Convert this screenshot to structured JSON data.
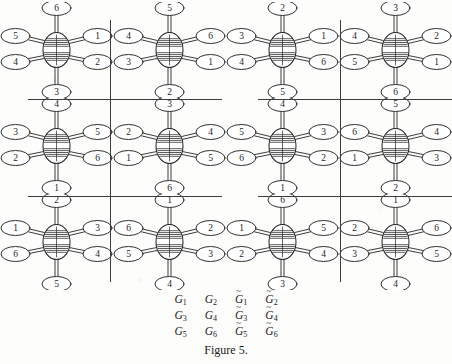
{
  "figure": {
    "caption": "Figure 5.",
    "background_color": "#fdfdfc",
    "ink_color": "#262626",
    "divider_color": "#3d3d3d"
  },
  "label_table": {
    "rows": [
      [
        {
          "base": "G",
          "tilde": false,
          "sub": "1"
        },
        {
          "base": "G",
          "tilde": false,
          "sub": "2"
        },
        {
          "base": "G",
          "tilde": true,
          "sub": "1"
        },
        {
          "base": "G",
          "tilde": true,
          "sub": "2"
        }
      ],
      [
        {
          "base": "G",
          "tilde": false,
          "sub": "3"
        },
        {
          "base": "G",
          "tilde": false,
          "sub": "4"
        },
        {
          "base": "G",
          "tilde": true,
          "sub": "3"
        },
        {
          "base": "G",
          "tilde": true,
          "sub": "4"
        }
      ],
      [
        {
          "base": "G",
          "tilde": false,
          "sub": "5"
        },
        {
          "base": "G",
          "tilde": false,
          "sub": "6"
        },
        {
          "base": "G",
          "tilde": true,
          "sub": "5"
        },
        {
          "base": "G",
          "tilde": true,
          "sub": "6"
        }
      ]
    ],
    "flat_labels": [
      "G1",
      "G2",
      "G~1",
      "G~2",
      "G3",
      "G4",
      "G~3",
      "G~4",
      "G5",
      "G6",
      "G~5",
      "G~6"
    ]
  },
  "grid": {
    "columns": 4,
    "rows": 3,
    "cell_width": 113,
    "cell_height": 96,
    "vertical_dividers_x": [
      110,
      340
    ],
    "horizontal_divider_rows": [
      {
        "y": 99,
        "segments": [
          [
            28,
            222
          ],
          [
            258,
            452
          ]
        ]
      },
      {
        "y": 196,
        "segments": [
          [
            28,
            222
          ],
          [
            258,
            452
          ]
        ]
      }
    ]
  },
  "molecules": [
    {
      "name": "G1",
      "row": 0,
      "col": 0,
      "positions": {
        "top": "6",
        "upper_right": "1",
        "lower_right": "2",
        "bottom": "3",
        "lower_left": "4",
        "upper_left": "5"
      }
    },
    {
      "name": "G2",
      "row": 0,
      "col": 1,
      "positions": {
        "top": "5",
        "upper_right": "6",
        "lower_right": "1",
        "bottom": "2",
        "lower_left": "3",
        "upper_left": "4"
      }
    },
    {
      "name": "G~1",
      "row": 0,
      "col": 2,
      "positions": {
        "top": "2",
        "upper_right": "1",
        "lower_right": "6",
        "bottom": "5",
        "lower_left": "4",
        "upper_left": "3"
      }
    },
    {
      "name": "G~2",
      "row": 0,
      "col": 3,
      "positions": {
        "top": "3",
        "upper_right": "2",
        "lower_right": "1",
        "bottom": "6",
        "lower_left": "5",
        "upper_left": "4"
      }
    },
    {
      "name": "G3",
      "row": 1,
      "col": 0,
      "positions": {
        "top": "4",
        "upper_right": "5",
        "lower_right": "6",
        "bottom": "1",
        "lower_left": "2",
        "upper_left": "3"
      }
    },
    {
      "name": "G4",
      "row": 1,
      "col": 1,
      "positions": {
        "top": "3",
        "upper_right": "4",
        "lower_right": "5",
        "bottom": "6",
        "lower_left": "1",
        "upper_left": "2"
      }
    },
    {
      "name": "G~3",
      "row": 1,
      "col": 2,
      "positions": {
        "top": "4",
        "upper_right": "3",
        "lower_right": "2",
        "bottom": "1",
        "lower_left": "6",
        "upper_left": "5"
      }
    },
    {
      "name": "G~4",
      "row": 1,
      "col": 3,
      "positions": {
        "top": "5",
        "upper_right": "4",
        "lower_right": "3",
        "bottom": "2",
        "lower_left": "1",
        "upper_left": "6"
      }
    },
    {
      "name": "G5",
      "row": 2,
      "col": 0,
      "positions": {
        "top": "2",
        "upper_right": "3",
        "lower_right": "4",
        "bottom": "5",
        "lower_left": "6",
        "upper_left": "1"
      }
    },
    {
      "name": "G6",
      "row": 2,
      "col": 1,
      "positions": {
        "top": "1",
        "upper_right": "2",
        "lower_right": "3",
        "bottom": "4",
        "lower_left": "5",
        "upper_left": "6"
      }
    },
    {
      "name": "G~5",
      "row": 2,
      "col": 2,
      "positions": {
        "top": "6",
        "upper_right": "5",
        "lower_right": "4",
        "bottom": "3",
        "lower_left": "2",
        "upper_left": "1"
      }
    },
    {
      "name": "G~6",
      "row": 2,
      "col": 3,
      "positions": {
        "top": "1",
        "upper_right": "6",
        "lower_right": "5",
        "bottom": "4",
        "lower_left": "3",
        "upper_left": "2"
      }
    }
  ]
}
